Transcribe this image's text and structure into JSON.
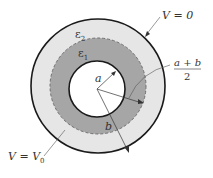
{
  "diagram": {
    "colors": {
      "outer_region": "#e6e6e6",
      "inner_region": "#a6a6a6",
      "core": "#ffffff",
      "stroke": "#1a1a1a",
      "thin_line": "#555555"
    },
    "labels": {
      "outer_potential": "V = 0",
      "inner_potential_prefix": "V = V",
      "inner_potential_sub": "0",
      "epsilon_outer": "ε",
      "epsilon_outer_sub": "2",
      "epsilon_inner": "ε",
      "epsilon_inner_sub": "1",
      "radius_a": "a",
      "radius_b": "b",
      "mid_radius_numerator": "a + b",
      "mid_radius_denominator": "2"
    }
  }
}
